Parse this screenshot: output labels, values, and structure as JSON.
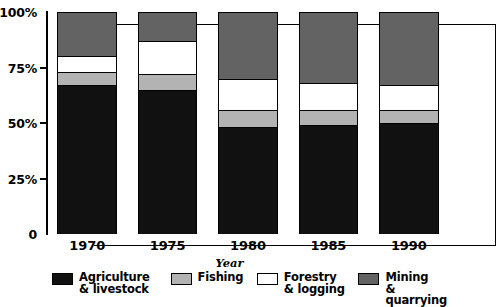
{
  "chart_data": {
    "type": "bar",
    "subtype": "stacked-bar-percent",
    "title": "",
    "xlabel": "Year",
    "ylabel": "",
    "categories": [
      "1970",
      "1975",
      "1980",
      "1985",
      "1990"
    ],
    "ylim": [
      0,
      100
    ],
    "ytick_labels": [
      "100%",
      "75%",
      "50%",
      "25%",
      "0"
    ],
    "ytick_values": [
      100,
      75,
      50,
      25,
      0
    ],
    "grid": false,
    "legend_position": "bottom",
    "stack_order_bottom_to_top": [
      "Agriculture & livestock",
      "Fishing",
      "Forestry & logging",
      "Mining & quarrying"
    ],
    "series": [
      {
        "name": "Agriculture\n& livestock",
        "legend_label": "Agriculture\n& livestock",
        "color": "#111111",
        "values": [
          67,
          65,
          48,
          49,
          50
        ]
      },
      {
        "name": "Fishing",
        "legend_label": "Fishing",
        "color": "#b3b3b3",
        "values": [
          6,
          7,
          8,
          7,
          6
        ]
      },
      {
        "name": "Forestry\n& logging",
        "legend_label": "Forestry\n& logging",
        "color": "#ffffff",
        "values": [
          7,
          15,
          14,
          12,
          11
        ]
      },
      {
        "name": "Mining\n& quarrying",
        "legend_label": "Mining\n& quarrying",
        "color": "#636363",
        "values": [
          20,
          13,
          30,
          32,
          33
        ]
      }
    ]
  },
  "axis": {
    "x_title": "Year",
    "y_ticks": [
      "100%",
      "75%",
      "50%",
      "25%",
      "0"
    ]
  },
  "colors": {
    "agriculture": "#111111",
    "fishing": "#b3b3b3",
    "forestry": "#ffffff",
    "mining": "#636363",
    "outline": "#000000",
    "background": "#ffffff"
  },
  "legend": {
    "items": [
      {
        "label": "Agriculture\n& livestock",
        "color": "#111111"
      },
      {
        "label": "Fishing",
        "color": "#b3b3b3"
      },
      {
        "label": "Forestry\n& logging",
        "color": "#ffffff"
      },
      {
        "label": "Mining\n& quarrying",
        "color": "#636363"
      }
    ]
  }
}
